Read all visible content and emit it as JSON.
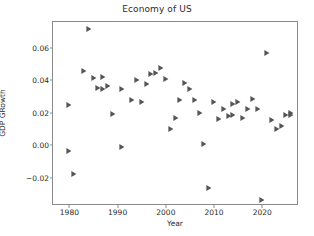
{
  "chart_data": {
    "type": "scatter",
    "title": "Economy of US",
    "xlabel": "Year",
    "ylabel": "GDP GRowth",
    "xlim": [
      1976.6,
      2027.6
    ],
    "ylim": [
      -0.0375,
      0.076
    ],
    "grid": false,
    "legend": null,
    "marker": "right-triangle",
    "marker_color": "#555555",
    "xticks": [
      1980,
      1990,
      2000,
      2010,
      2020
    ],
    "xtick_labels": [
      "1980",
      "1990",
      "2000",
      "2010",
      "2020"
    ],
    "yticks": [
      -0.02,
      0.0,
      0.02,
      0.04,
      0.06
    ],
    "ytick_labels": [
      "−0.02",
      "0.00",
      "0.02",
      "0.04",
      "0.06"
    ],
    "series_name": "GDP Growth",
    "points": [
      {
        "x": 1980,
        "y": -0.0035
      },
      {
        "x": 1980,
        "y": 0.0249
      },
      {
        "x": 1981,
        "y": -0.018
      },
      {
        "x": 1983,
        "y": 0.0458
      },
      {
        "x": 1984,
        "y": 0.0718
      },
      {
        "x": 1985,
        "y": 0.0417
      },
      {
        "x": 1986,
        "y": 0.035
      },
      {
        "x": 1987,
        "y": 0.0349
      },
      {
        "x": 1987,
        "y": 0.0419
      },
      {
        "x": 1988,
        "y": 0.0368
      },
      {
        "x": 1989,
        "y": 0.019
      },
      {
        "x": 1991,
        "y": -0.0011
      },
      {
        "x": 1991,
        "y": 0.0349
      },
      {
        "x": 1993,
        "y": 0.0278
      },
      {
        "x": 1994,
        "y": 0.04
      },
      {
        "x": 1995,
        "y": 0.0266
      },
      {
        "x": 1996,
        "y": 0.0377
      },
      {
        "x": 1997,
        "y": 0.044
      },
      {
        "x": 1998,
        "y": 0.0448
      },
      {
        "x": 1999,
        "y": 0.0479
      },
      {
        "x": 2000,
        "y": 0.0408
      },
      {
        "x": 2001,
        "y": 0.0098
      },
      {
        "x": 2002,
        "y": 0.0168
      },
      {
        "x": 2003,
        "y": 0.0279
      },
      {
        "x": 2004,
        "y": 0.0386
      },
      {
        "x": 2005,
        "y": 0.0348
      },
      {
        "x": 2006,
        "y": 0.0279
      },
      {
        "x": 2007,
        "y": 0.0196
      },
      {
        "x": 2008,
        "y": 0.0005
      },
      {
        "x": 2009,
        "y": -0.0261
      },
      {
        "x": 2010,
        "y": 0.0265
      },
      {
        "x": 2011,
        "y": 0.0159
      },
      {
        "x": 2012,
        "y": 0.0224
      },
      {
        "x": 2013,
        "y": 0.018
      },
      {
        "x": 2014,
        "y": 0.0252
      },
      {
        "x": 2014,
        "y": 0.0187
      },
      {
        "x": 2015,
        "y": 0.0267
      },
      {
        "x": 2016,
        "y": 0.0168
      },
      {
        "x": 2017,
        "y": 0.0224
      },
      {
        "x": 2018,
        "y": 0.0288
      },
      {
        "x": 2019,
        "y": 0.0226
      },
      {
        "x": 2020,
        "y": -0.0338
      },
      {
        "x": 2021,
        "y": 0.0571
      },
      {
        "x": 2022,
        "y": 0.0157
      },
      {
        "x": 2023,
        "y": 0.0098
      },
      {
        "x": 2024,
        "y": 0.0119
      },
      {
        "x": 2025,
        "y": 0.0189
      },
      {
        "x": 2026,
        "y": 0.0201
      },
      {
        "x": 2026,
        "y": 0.0185
      }
    ]
  }
}
